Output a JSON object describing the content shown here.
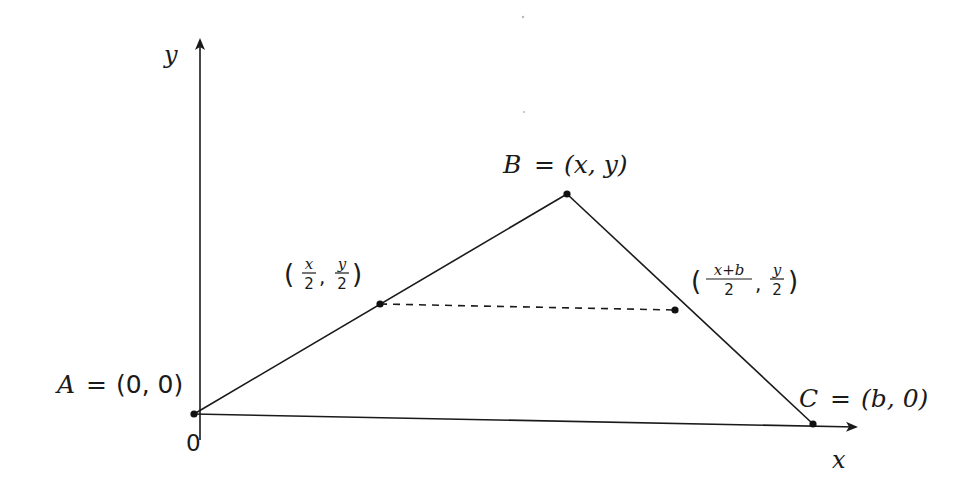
{
  "axes": {
    "x_label": "x",
    "y_label": "y",
    "origin_label": "0"
  },
  "points": {
    "A": {
      "name": "A",
      "eq": "=",
      "coords": "(0, 0)",
      "x_val": "0",
      "y_val": "0"
    },
    "B": {
      "name": "B",
      "eq": "=",
      "coords": "(x, y)",
      "x_val": "x",
      "y_val": "y"
    },
    "C": {
      "name": "C",
      "eq": "=",
      "coords": "(b, 0)",
      "x_val": "b",
      "y_val": "0"
    }
  },
  "midpoints": {
    "AB": {
      "x_num": "x",
      "x_den": "2",
      "y_num": "y",
      "y_den": "2",
      "open": "(",
      "close": ")",
      "sep": ","
    },
    "BC": {
      "x_num": "x+b",
      "x_den": "2",
      "y_num": "y",
      "y_den": "2",
      "open": "(",
      "close": ")",
      "sep": ","
    }
  },
  "segments": [
    {
      "from": "A",
      "to": "B",
      "style": "solid"
    },
    {
      "from": "B",
      "to": "C",
      "style": "solid"
    },
    {
      "from": "A",
      "to": "C",
      "style": "solid"
    },
    {
      "from": "mid_AB",
      "to": "mid_BC",
      "style": "dashed"
    }
  ]
}
